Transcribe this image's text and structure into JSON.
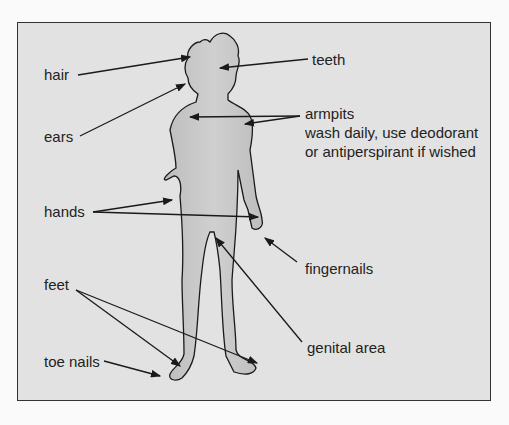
{
  "diagram": {
    "type": "labelled body diagram",
    "colors": {
      "background": "#e2e2e2",
      "frame_border": "#333333",
      "skin": "#c9c9c9",
      "lines": "#1a1a1a"
    },
    "labels": {
      "hair": "hair",
      "ears": "ears",
      "hands": "hands",
      "feet": "feet",
      "toe_nails": "toe nails",
      "teeth": "teeth",
      "armpits": "armpits",
      "armpits_note_1": "wash daily, use deodorant",
      "armpits_note_2": "or antiperspirant if wished",
      "fingernails": "fingernails",
      "genital_area": "genital area"
    }
  }
}
